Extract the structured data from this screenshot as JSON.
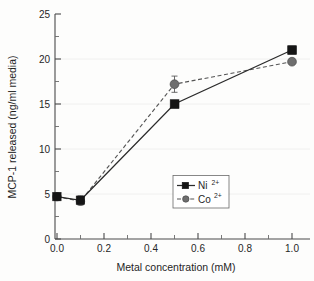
{
  "chart_data": {
    "type": "line",
    "title": "",
    "xlabel": "Metal concentration (mM)",
    "ylabel": "MCP-1 released (ng/ml media)",
    "xlim": [
      -0.04,
      1.06
    ],
    "ylim": [
      0,
      25
    ],
    "x": [
      0.0,
      0.1,
      0.5,
      1.0
    ],
    "xticks": [
      0.0,
      0.2,
      0.4,
      0.6,
      0.8,
      1.0
    ],
    "xtick_labels": [
      "0.0",
      "0.2",
      "0.4",
      "0.6",
      "0.8",
      "1.0"
    ],
    "yticks": [
      0,
      5,
      10,
      15,
      20,
      25
    ],
    "ytick_labels": [
      "0",
      "5",
      "10",
      "15",
      "20",
      "25"
    ],
    "yticks_minor": [
      2.5,
      7.5,
      12.5,
      17.5,
      22.5
    ],
    "grid": "faint-horizontal",
    "legend_position": "center-right-lower",
    "series": [
      {
        "name": "Ni2+",
        "label_base": "Ni",
        "label_sup": "2+",
        "marker": "square",
        "linestyle": "solid",
        "color": "#151515",
        "values": [
          4.7,
          4.3,
          15.0,
          21.0
        ],
        "errors": [
          0.4,
          0.5,
          0.3,
          0.4
        ]
      },
      {
        "name": "Co2+",
        "label_base": "Co",
        "label_sup": "2+",
        "marker": "circle",
        "linestyle": "dashed",
        "color": "#6e6e6e",
        "values": [
          4.7,
          4.2,
          17.2,
          19.7
        ],
        "errors": [
          0.3,
          0.4,
          0.9,
          0.3
        ]
      }
    ]
  },
  "figure": {
    "background_color": "#fdfdfc",
    "axis_color": "#4a4a4a",
    "grid_color": "#ececec"
  }
}
